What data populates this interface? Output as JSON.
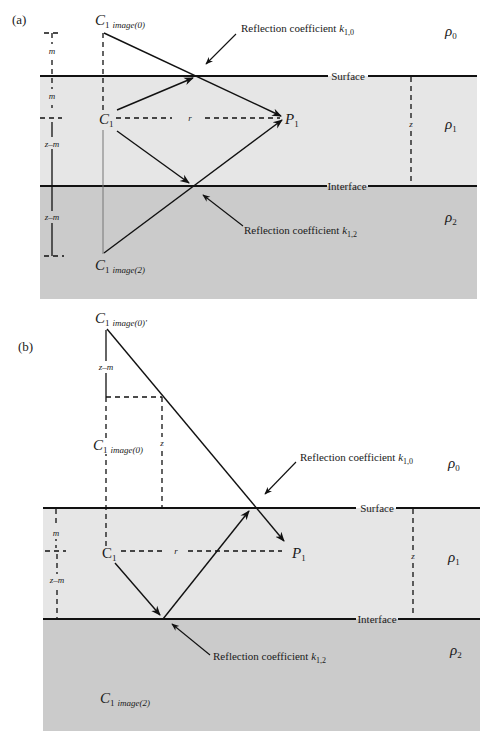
{
  "colors": {
    "layer0": "#ffffff",
    "layer1": "#e6e6e6",
    "layer2": "#cbcbcb",
    "line": "#111111"
  },
  "panel_a": {
    "label": "(a)",
    "source_image0": {
      "base": "C",
      "sub1": "1",
      "sub2": "image(0)"
    },
    "source": {
      "base": "C",
      "sub": "1"
    },
    "source_image2": {
      "base": "C",
      "sub1": "1",
      "sub2": "image(2)"
    },
    "receiver": {
      "base": "P",
      "sub": "1"
    },
    "surface_label": "Surface",
    "interface_label": "Interface",
    "reflection_top": {
      "text": "Reflection coefficient ",
      "k": "k",
      "sub": "1,0"
    },
    "reflection_bottom": {
      "text": "Reflection coefficient ",
      "k": "k",
      "sub": "1,2"
    },
    "rho0": {
      "base": "ρ",
      "sub": "0"
    },
    "rho1": {
      "base": "ρ",
      "sub": "1"
    },
    "rho2": {
      "base": "ρ",
      "sub": "2"
    },
    "dim_m_upper": "m",
    "dim_m_lower": "m",
    "dim_zm_upper": "z–m",
    "dim_zm_lower": "z–m",
    "dim_r": "r",
    "dim_z": "z"
  },
  "panel_b": {
    "label": "(b)",
    "source_image0_prime": {
      "base": "C",
      "sub1": "1",
      "sub2": "image(0)'"
    },
    "source_image0": {
      "base": "C",
      "sub1": "1",
      "sub2": "image(0)"
    },
    "source": {
      "base": "C",
      "sub": "1"
    },
    "source_image2": {
      "base": "C",
      "sub1": "1",
      "sub2": "image(2)"
    },
    "receiver": {
      "base": "P",
      "sub": "1"
    },
    "surface_label": "Surface",
    "interface_label": "Interface",
    "reflection_top": {
      "text": "Reflection coefficient ",
      "k": "k",
      "sub": "1,0"
    },
    "reflection_bottom": {
      "text": "Reflection coefficient ",
      "k": "k",
      "sub": "1,2"
    },
    "rho0": {
      "base": "ρ",
      "sub": "0"
    },
    "rho1": {
      "base": "ρ",
      "sub": "1"
    },
    "rho2": {
      "base": "ρ",
      "sub": "2"
    },
    "dim_zm_top": "z–m",
    "dim_z_inner": "z",
    "dim_m": "m",
    "dim_zm": "z–m",
    "dim_r": "r",
    "dim_z": "z"
  }
}
